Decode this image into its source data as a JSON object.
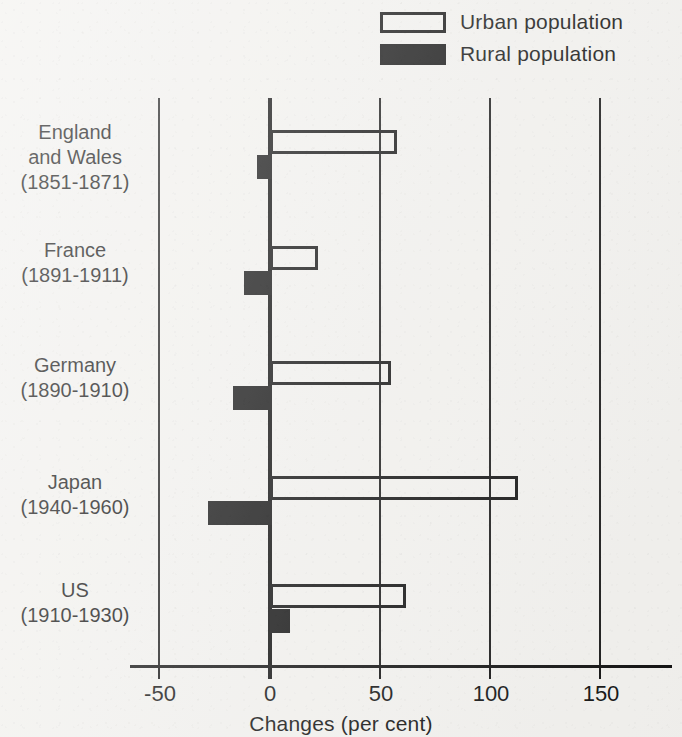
{
  "legend": {
    "items": [
      {
        "label": "Urban population",
        "style": "hollow",
        "swatch_name": "urban-swatch"
      },
      {
        "label": "Rural population",
        "style": "filled",
        "swatch_name": "rural-swatch"
      }
    ]
  },
  "axis": {
    "title": "Changes (per cent)",
    "ticks": [
      "-50",
      "0",
      "50",
      "100",
      "150"
    ]
  },
  "chart_data": {
    "type": "bar",
    "orientation": "horizontal",
    "title": "",
    "xlabel": "Changes (per cent)",
    "ylabel": "",
    "xlim": [
      -50,
      175
    ],
    "xticks": [
      -50,
      0,
      50,
      100,
      150
    ],
    "grid": true,
    "legend_position": "top-right",
    "categories": [
      "England\nand Wales\n(1851-1871)",
      "France\n(1891-1911)",
      "Germany\n(1890-1910)",
      "Japan\n(1940-1960)",
      "US\n(1910-1930)"
    ],
    "series": [
      {
        "name": "Urban population",
        "values": [
          57,
          21,
          54,
          112,
          61
        ]
      },
      {
        "name": "Rural population",
        "values": [
          -6,
          -12,
          -17,
          -28,
          8
        ]
      }
    ]
  },
  "rows": [
    {
      "label": "England\nand Wales\n(1851-1871)",
      "label_top": 22,
      "urban": 57,
      "rural": -6,
      "urban_top": 32,
      "rural_top": 57
    },
    {
      "label": "France\n(1891-1911)",
      "label_top": 140,
      "urban": 21,
      "rural": -12,
      "urban_top": 148,
      "rural_top": 173
    },
    {
      "label": "Germany\n(1890-1910)",
      "label_top": 255,
      "urban": 54,
      "rural": -17,
      "urban_top": 263,
      "rural_top": 288
    },
    {
      "label": "Japan\n(1940-1960)",
      "label_top": 372,
      "urban": 112,
      "rural": -28,
      "urban_top": 378,
      "rural_top": 403
    },
    {
      "label": "US\n(1910-1930)",
      "label_top": 480,
      "urban": 61,
      "rural": 8,
      "urban_top": 486,
      "rural_top": 511
    }
  ],
  "scale": {
    "zero_x": 270,
    "px_per_unit": 2.2
  }
}
